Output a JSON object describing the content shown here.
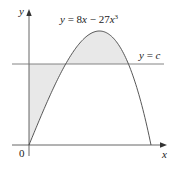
{
  "figure": {
    "curve_label": "y = 8x − 27x³",
    "curve_label_parts": {
      "lhs": "y",
      "eq": " = 8",
      "x1": "x",
      "mid": " − 27",
      "x2": "x",
      "exp": "3"
    },
    "line_label": "y = c",
    "line_label_parts": {
      "lhs": "y",
      "eq": " = ",
      "rhs": "c"
    },
    "x_axis_label": "x",
    "y_axis_label": "y",
    "origin_label": "0",
    "colors": {
      "axis": "#555555",
      "curve": "#444444",
      "line": "#777777",
      "shade": "#e8e8e8",
      "text": "#222222"
    }
  },
  "chart_data": {
    "type": "line",
    "title": "",
    "series": [
      {
        "name": "y = 8x − 27x³",
        "function": "8x - 27x^3",
        "x_range": [
          0,
          0.544
        ]
      },
      {
        "name": "y = c",
        "function": "c",
        "value_estimate": 1.19
      }
    ],
    "shaded_regions": [
      {
        "description": "between y-axis, y=c and curve, from x=0 to first intersection"
      },
      {
        "description": "between curve and y=c above the line, between the two intersections"
      }
    ],
    "xlabel": "x",
    "ylabel": "y",
    "grid": false
  }
}
